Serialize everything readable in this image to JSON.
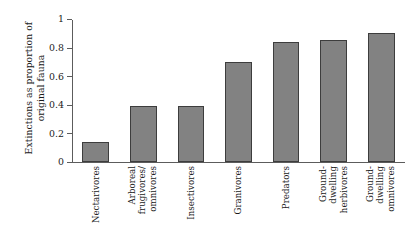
{
  "chart_data": {
    "type": "bar",
    "title": "",
    "xlabel": "",
    "ylabel": "Extinctions as proportion of original fauna",
    "ylabel_lines": [
      "Extinctions as proportion of",
      "original fauna"
    ],
    "ylim": [
      0,
      1
    ],
    "yticks": [
      0,
      0.2,
      0.4,
      0.6,
      0.8,
      1
    ],
    "ytick_labels": [
      "0",
      "0.2",
      "0.4",
      "0.6",
      "0.8",
      "1"
    ],
    "grid": false,
    "legend": false,
    "bar_color": "#828282",
    "bar_edge_color": "#3d3d3d",
    "axis_color": "#5c5c5c",
    "categories": [
      "Nectarivores",
      "Arboreal frugivores/omnivores",
      "Insectivores",
      "Granivores",
      "Predators",
      "Ground-dwelling herbivores",
      "Ground-dwelling omnivores"
    ],
    "category_label_lines": [
      [
        "Nectarivores"
      ],
      [
        "Arboreal",
        "frugivores/",
        "omnivores"
      ],
      [
        "Insectivores"
      ],
      [
        "Granivores"
      ],
      [
        "Predators"
      ],
      [
        "Ground-",
        "dwelling",
        "herbivores"
      ],
      [
        "Ground-",
        "dwelling",
        "omnivores"
      ]
    ],
    "values": [
      0.14,
      0.39,
      0.39,
      0.7,
      0.84,
      0.85,
      0.9
    ]
  }
}
